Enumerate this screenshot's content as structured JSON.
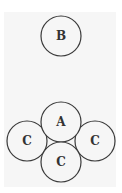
{
  "diagram": {
    "top_group": {
      "circles": [
        {
          "label": "B",
          "cx": 61,
          "cy": 36,
          "r": 20
        }
      ]
    },
    "bottom_group": {
      "circles": [
        {
          "label": "A",
          "cx": 61,
          "cy": 122,
          "r": 20
        },
        {
          "label": "C",
          "cx": 27,
          "cy": 141,
          "r": 20
        },
        {
          "label": "C",
          "cx": 95,
          "cy": 141,
          "r": 20
        },
        {
          "label": "C",
          "cx": 61,
          "cy": 162,
          "r": 20
        }
      ]
    },
    "colors": {
      "stroke": "#3a3a3a",
      "text": "#333333",
      "background": "#f6f6f6"
    }
  }
}
